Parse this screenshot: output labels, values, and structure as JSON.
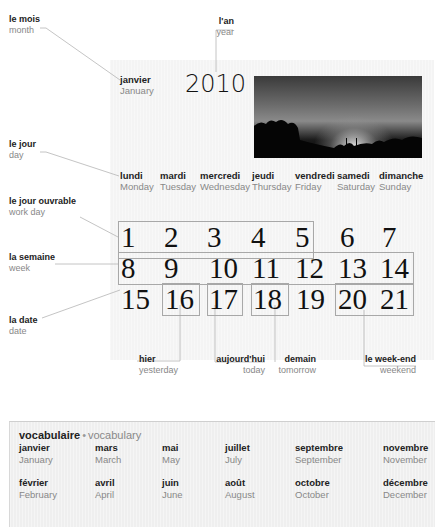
{
  "annotations": {
    "month": {
      "fr": "le mois",
      "en": "month"
    },
    "year": {
      "fr": "l'an",
      "en": "year"
    },
    "day": {
      "fr": "le jour",
      "en": "day"
    },
    "work_day": {
      "fr": "le jour ouvrable",
      "en": "work day"
    },
    "week": {
      "fr": "la semaine",
      "en": "week"
    },
    "date": {
      "fr": "la date",
      "en": "date"
    },
    "yesterday": {
      "fr": "hier",
      "en": "yesterday"
    },
    "today": {
      "fr": "aujourd'hui",
      "en": "today"
    },
    "tomorrow": {
      "fr": "demain",
      "en": "tomorrow"
    },
    "weekend": {
      "fr": "le week-end",
      "en": "weekend"
    }
  },
  "calendar": {
    "month": {
      "fr": "janvier",
      "en": "January"
    },
    "year": "2010",
    "weekdays": [
      {
        "fr": "lundi",
        "en": "Monday"
      },
      {
        "fr": "mardi",
        "en": "Tuesday"
      },
      {
        "fr": "mercredi",
        "en": "Wednesday"
      },
      {
        "fr": "jeudi",
        "en": "Thursday"
      },
      {
        "fr": "vendredi",
        "en": "Friday"
      },
      {
        "fr": "samedi",
        "en": "Saturday"
      },
      {
        "fr": "dimanche",
        "en": "Sunday"
      }
    ],
    "weeks": [
      [
        "1",
        "2",
        "3",
        "4",
        "5",
        "6",
        "7"
      ],
      [
        "8",
        "9",
        "10",
        "11",
        "12",
        "13",
        "14"
      ],
      [
        "15",
        "16",
        "17",
        "18",
        "19",
        "20",
        "21"
      ]
    ]
  },
  "vocabulary": {
    "title_fr": "vocabulaire",
    "separator": "•",
    "title_en": "vocabulary",
    "months": [
      {
        "fr": "janvier",
        "en": "January"
      },
      {
        "fr": "février",
        "en": "February"
      },
      {
        "fr": "mars",
        "en": "March"
      },
      {
        "fr": "avril",
        "en": "April"
      },
      {
        "fr": "mai",
        "en": "May"
      },
      {
        "fr": "juin",
        "en": "June"
      },
      {
        "fr": "juillet",
        "en": "July"
      },
      {
        "fr": "août",
        "en": "August"
      },
      {
        "fr": "septembre",
        "en": "September"
      },
      {
        "fr": "octobre",
        "en": "October"
      },
      {
        "fr": "novembre",
        "en": "November"
      },
      {
        "fr": "décembre",
        "en": "December"
      }
    ]
  }
}
